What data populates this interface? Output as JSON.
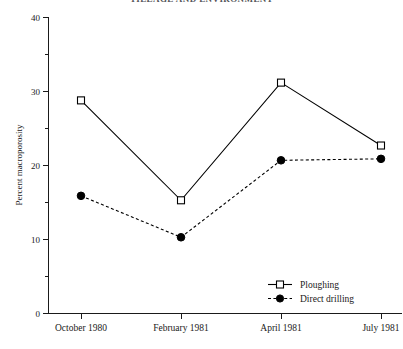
{
  "chart_data": {
    "type": "line",
    "title": "TILLAGE AND ENVIRONMENT",
    "xlabel": "",
    "ylabel": "Percent macroporosity",
    "categories": [
      "October 1980",
      "February 1981",
      "April 1981",
      "July 1981"
    ],
    "ylim": [
      0,
      40
    ],
    "y_major_ticks": [
      0,
      10,
      20,
      30,
      40
    ],
    "y_major_tick_labels": [
      "0",
      "10",
      "20",
      "30",
      "40"
    ],
    "y_minor_ticks": [
      5,
      15,
      25,
      35
    ],
    "grid": false,
    "legend_position": "bottom-right",
    "series": [
      {
        "name": "Ploughing",
        "values": [
          28.8,
          15.3,
          31.2,
          22.7
        ],
        "line_style": "solid",
        "marker": "open-square",
        "color": "#000000"
      },
      {
        "name": "Direct drilling",
        "values": [
          15.9,
          10.3,
          20.7,
          20.9
        ],
        "line_style": "dashed",
        "marker": "filled-circle",
        "color": "#000000"
      }
    ]
  },
  "legend": {
    "items": [
      {
        "label": "Ploughing"
      },
      {
        "label": "Direct drilling"
      }
    ]
  },
  "axes": {
    "y_axis_title": "Percent macroporosity",
    "y_labels": [
      "40",
      "30",
      "20",
      "10",
      "0"
    ],
    "x_labels": [
      "October 1980",
      "February 1981",
      "April 1981",
      "July 1981"
    ]
  }
}
